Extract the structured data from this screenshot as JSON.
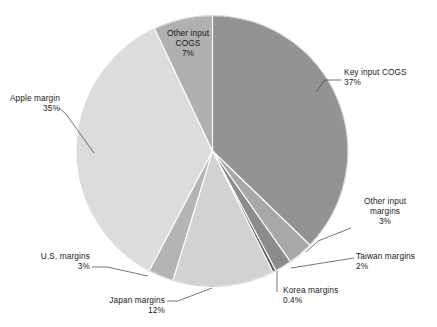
{
  "chart_data": {
    "type": "pie",
    "title": "",
    "subtitle": "",
    "xlabel": "",
    "ylabel": "",
    "legend_position": "none",
    "grid": false,
    "value_unit": "%",
    "start_angle_deg": 0,
    "direction": "clockwise",
    "categories": [
      "Key input COGS",
      "Other input margins",
      "Taiwan margins",
      "Korea margins",
      "Japan margins",
      "U.S. margins",
      "Apple margin",
      "Other input COGS"
    ],
    "values": [
      37,
      3,
      2,
      0.4,
      12,
      3,
      35,
      7
    ],
    "labels": [
      {
        "name": "Key input COGS",
        "value": 37,
        "value_text": "37%",
        "color": "#939393"
      },
      {
        "name": "Other input margins",
        "value": 3,
        "value_text": "3%",
        "color": "#a8a8a8"
      },
      {
        "name": "Taiwan margins",
        "value": 2,
        "value_text": "2%",
        "color": "#8c8c8c"
      },
      {
        "name": "Korea margins",
        "value": 0.4,
        "value_text": "0.4%",
        "color": "#5a5a5a"
      },
      {
        "name": "Japan margins",
        "value": 12,
        "value_text": "12%",
        "color": "#d2d2d2"
      },
      {
        "name": "U.S. margins",
        "value": 3,
        "value_text": "3%",
        "color": "#b4b4b4"
      },
      {
        "name": "Apple margin",
        "value": 35,
        "value_text": "35%",
        "color": "#dcdcdc"
      },
      {
        "name": "Other input COGS",
        "value": 7,
        "value_text": "7%",
        "color": "#b0b0b0"
      }
    ]
  },
  "labels": {
    "key_input_cogs": {
      "name": "Key input COGS",
      "value": "37%"
    },
    "other_input_margins": {
      "name": "Other input",
      "name2": "margins",
      "value": "3%"
    },
    "taiwan_margins": {
      "name": "Taiwan margins",
      "value": "2%"
    },
    "korea_margins": {
      "name": "Korea margins",
      "value": "0.4%"
    },
    "japan_margins": {
      "name": "Japan margins",
      "value": "12%"
    },
    "us_margins": {
      "name": "U.S. margins",
      "value": "3%"
    },
    "apple_margin": {
      "name": "Apple margin",
      "value": "35%"
    },
    "other_input_cogs": {
      "name": "Other input",
      "name2": "COGS",
      "value": "7%"
    }
  },
  "colors": {
    "background": "#ffffff",
    "text": "#1a1a1a",
    "leader_line": "#3a3a3a",
    "slice_divider": "#ffffff"
  }
}
